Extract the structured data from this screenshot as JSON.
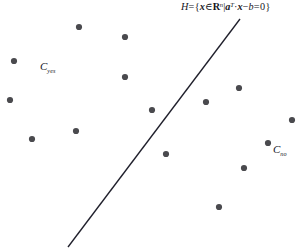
{
  "figure": {
    "background_color": "#ffffff",
    "width": 301,
    "height": 250
  },
  "annotations": {
    "hyperplane_equation": {
      "full_text": "H = {x ∈ ℝⁿ | aᵀ·x − b = 0}",
      "H": "H",
      "equals": "=",
      "open_brace": "{",
      "x_var": "x",
      "element_of": "∈",
      "reals": "R",
      "dim_exponent": "n",
      "given_bar": "|",
      "a_var": "a",
      "transpose": "T",
      "dot_operator": "·",
      "x_var2": "x",
      "minus": "−",
      "b_var": "b",
      "equals2": "=",
      "zero": "0",
      "close_brace": "}"
    },
    "class_yes": {
      "base": "C",
      "subscript": "yes",
      "full_text": "Cyes"
    },
    "class_no": {
      "base": "C",
      "subscript": "no",
      "full_text": "Cno"
    }
  },
  "chart_data": {
    "type": "scatter",
    "title": "",
    "xlabel": "",
    "ylabel": "",
    "xlim": [
      0,
      301
    ],
    "ylim": [
      0,
      250
    ],
    "grid": false,
    "legend_position": "none",
    "colors": {
      "point": "#4a4a4e",
      "line": "#20202c",
      "text": "#15151c",
      "background": "#ffffff"
    },
    "point_radius": 3.1,
    "series": [
      {
        "name": "Cyes",
        "marker": "filled-circle",
        "color": "#4a4a4e",
        "points": [
          [
            79,
            27
          ],
          [
            125,
            37
          ],
          [
            14,
            61
          ],
          [
            125,
            77
          ],
          [
            10,
            100
          ],
          [
            152,
            110
          ],
          [
            76,
            131
          ],
          [
            32,
            139
          ]
        ]
      },
      {
        "name": "Cno",
        "marker": "filled-circle",
        "color": "#4a4a4e",
        "points": [
          [
            239,
            88
          ],
          [
            206,
            102
          ],
          [
            292,
            120
          ],
          [
            268,
            143
          ],
          [
            166,
            154
          ],
          [
            244,
            168
          ],
          [
            219,
            207
          ]
        ]
      }
    ],
    "separating_line": {
      "name": "H",
      "color": "#20202c",
      "width": 1.35,
      "x1": 240,
      "y1": 19,
      "x2": 68,
      "y2": 247
    }
  }
}
